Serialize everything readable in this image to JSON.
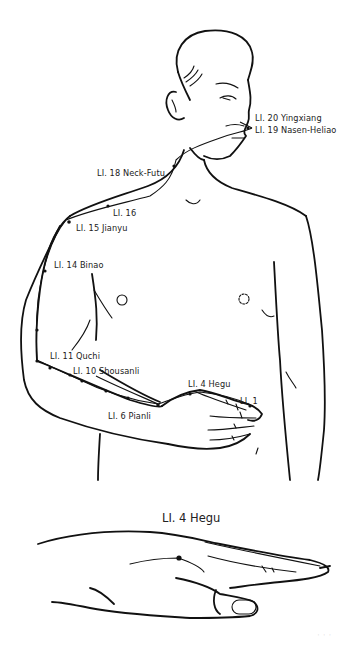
{
  "figure": {
    "meridian": "Large Intestine",
    "labels": [
      {
        "id": "li20",
        "text": "LI. 20 Yingxiang",
        "x": 255,
        "y": 114
      },
      {
        "id": "li19",
        "text": "LI. 19 Nasen-Heliao",
        "x": 255,
        "y": 126
      },
      {
        "id": "li18",
        "text": "LI. 18 Neck-Futu",
        "x": 97,
        "y": 169
      },
      {
        "id": "li16",
        "text": "LI. 16",
        "x": 113,
        "y": 209
      },
      {
        "id": "li15",
        "text": "LI. 15 Jianyu",
        "x": 76,
        "y": 224
      },
      {
        "id": "li14",
        "text": "LI. 14 Binao",
        "x": 54,
        "y": 261
      },
      {
        "id": "li11",
        "text": "LI. 11 Quchi",
        "x": 50,
        "y": 352
      },
      {
        "id": "li10",
        "text": "LI. 10 Shousanli",
        "x": 73,
        "y": 367
      },
      {
        "id": "li4",
        "text": "LI. 4 Hegu",
        "x": 188,
        "y": 380
      },
      {
        "id": "li1",
        "text": "LI. 1",
        "x": 240,
        "y": 397
      },
      {
        "id": "li6",
        "text": "LI. 6 Pianli",
        "x": 108,
        "y": 412
      }
    ],
    "detail_title": "LI. 4 Hegu",
    "footer_mark": "· · ·"
  }
}
